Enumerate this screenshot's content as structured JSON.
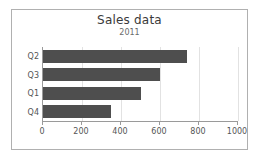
{
  "chart_data": {
    "type": "bar",
    "orientation": "horizontal",
    "title": "Sales data",
    "subtitle": "2011",
    "xlabel": "",
    "ylabel": "",
    "categories": [
      "Q2",
      "Q3",
      "Q1",
      "Q4"
    ],
    "values": [
      740,
      600,
      500,
      350
    ],
    "xlim": [
      0,
      1000
    ],
    "xticks": [
      0,
      200,
      400,
      600,
      800,
      1000
    ],
    "xtick_labels": [
      "0",
      "200",
      "400",
      "600",
      "800",
      "1000"
    ],
    "grid": "vertical",
    "legend": "none",
    "series": [
      {
        "name": "Sales",
        "values": [
          740,
          600,
          500,
          350
        ]
      }
    ]
  },
  "style": {
    "bar_color": "#4e4e4e",
    "grid_color": "#e2e2e2",
    "axis_color": "#9a9a9a",
    "frame_color": "#b0b0b0",
    "title_color": "#3a3a3a",
    "tick_label_color": "#555555",
    "background": "#ffffff"
  }
}
